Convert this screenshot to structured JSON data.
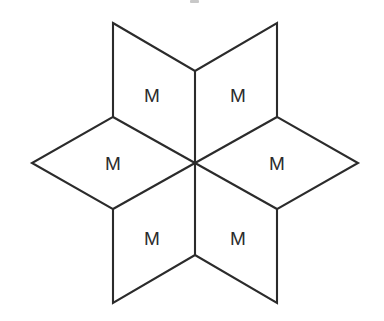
{
  "figure": {
    "background_color": "#ffffff",
    "stroke_color": "#2b2b2b",
    "fill_color": "#ffffff",
    "stroke_width": 2.1,
    "label_color": "#2b2b2b",
    "label_font_size": 19,
    "width": 384,
    "height": 321,
    "center": {
      "x": 195,
      "y": 163
    },
    "outer_points": [
      {
        "name": "top-left-point",
        "x": 113,
        "y": 23
      },
      {
        "name": "top-right-point",
        "x": 277,
        "y": 23
      },
      {
        "name": "right-point",
        "x": 358,
        "y": 163
      },
      {
        "name": "bottom-right-point",
        "x": 277,
        "y": 303
      },
      {
        "name": "bottom-left-point",
        "x": 113,
        "y": 303
      },
      {
        "name": "left-point",
        "x": 32,
        "y": 163
      }
    ],
    "notch_points": [
      {
        "name": "top-notch",
        "x": 195,
        "y": 71
      },
      {
        "name": "upper-right-notch",
        "x": 277,
        "y": 117
      },
      {
        "name": "lower-right-notch",
        "x": 277,
        "y": 209
      },
      {
        "name": "bottom-notch",
        "x": 195,
        "y": 255
      },
      {
        "name": "lower-left-notch",
        "x": 113,
        "y": 209
      },
      {
        "name": "upper-left-notch",
        "x": 113,
        "y": 117
      }
    ],
    "rhombi": [
      {
        "id": "rhombus-top-left",
        "label": "M",
        "label_x": 152,
        "label_y": 95,
        "points": "113,23 195,71 195,163 113,117"
      },
      {
        "id": "rhombus-top-right",
        "label": "M",
        "label_x": 238,
        "label_y": 95,
        "points": "277,23 277,117 195,163 195,71"
      },
      {
        "id": "rhombus-right",
        "label": "M",
        "label_x": 277,
        "label_y": 163,
        "points": "277,117 358,163 277,209 195,163"
      },
      {
        "id": "rhombus-bottom-right",
        "label": "M",
        "label_x": 238,
        "label_y": 238,
        "points": "277,209 277,303 195,255 195,163"
      },
      {
        "id": "rhombus-bottom-left",
        "label": "M",
        "label_x": 152,
        "label_y": 238,
        "points": "195,163 195,255 113,303 113,209"
      },
      {
        "id": "rhombus-left",
        "label": "M",
        "label_x": 113,
        "label_y": 163,
        "points": "113,117 195,163 113,209 32,163"
      }
    ],
    "spokes": [
      {
        "name": "spoke-up",
        "x1": 195,
        "y1": 163,
        "x2": 195,
        "y2": 71
      },
      {
        "name": "spoke-upper-right",
        "x1": 195,
        "y1": 163,
        "x2": 277,
        "y2": 117
      },
      {
        "name": "spoke-lower-right",
        "x1": 195,
        "y1": 163,
        "x2": 277,
        "y2": 209
      },
      {
        "name": "spoke-down",
        "x1": 195,
        "y1": 163,
        "x2": 195,
        "y2": 255
      },
      {
        "name": "spoke-lower-left",
        "x1": 195,
        "y1": 163,
        "x2": 113,
        "y2": 209
      },
      {
        "name": "spoke-upper-left",
        "x1": 195,
        "y1": 163,
        "x2": 113,
        "y2": 117
      }
    ],
    "outline": "113,23 195,71 277,23 277,117 358,163 277,209 277,303 195,255 113,303 113,209 32,163 113,117"
  }
}
